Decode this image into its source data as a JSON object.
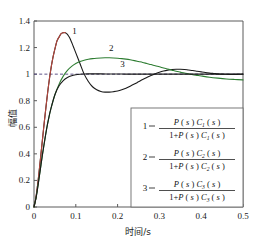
{
  "chart_data": {
    "type": "line",
    "title": "",
    "xlabel": "时间/s",
    "ylabel": "幅值",
    "xlim": [
      0,
      0.5
    ],
    "ylim": [
      0,
      1.4
    ],
    "xticks": [
      "0",
      "0.1",
      "0.2",
      "0.3",
      "0.4",
      "0.5"
    ],
    "xtick_values": [
      0,
      0.1,
      0.2,
      0.3,
      0.4,
      0.5
    ],
    "yticks": [
      "0",
      "0.2",
      "0.4",
      "0.6",
      "0.8",
      "1",
      "1.2",
      "1.4"
    ],
    "ytick_values": [
      0,
      0.2,
      0.4,
      0.6,
      0.8,
      1.0,
      1.2,
      1.4
    ],
    "grid": false,
    "legend_position": "lower-right",
    "reference_line": {
      "name": "unit-step-reference",
      "y": 1.0,
      "style": "dashed",
      "color": "#4b3f7a"
    },
    "series": [
      {
        "name": "curve-1",
        "label": "1",
        "color": "#1a1a1a",
        "label_x": 0.097,
        "label_y": 1.3,
        "x": [
          0,
          0.004,
          0.008,
          0.012,
          0.016,
          0.02,
          0.025,
          0.03,
          0.035,
          0.04,
          0.045,
          0.05,
          0.055,
          0.06,
          0.065,
          0.07,
          0.075,
          0.08,
          0.085,
          0.09,
          0.095,
          0.1,
          0.11,
          0.12,
          0.13,
          0.14,
          0.15,
          0.16,
          0.17,
          0.18,
          0.19,
          0.2,
          0.21,
          0.22,
          0.23,
          0.24,
          0.25,
          0.26,
          0.27,
          0.28,
          0.29,
          0.3,
          0.31,
          0.32,
          0.33,
          0.34,
          0.35,
          0.36,
          0.37,
          0.38,
          0.39,
          0.4,
          0.41,
          0.42,
          0.43,
          0.44,
          0.45,
          0.46,
          0.47,
          0.48,
          0.49,
          0.5
        ],
        "y": [
          0,
          0.06,
          0.15,
          0.26,
          0.38,
          0.5,
          0.65,
          0.79,
          0.92,
          1.03,
          1.12,
          1.19,
          1.25,
          1.28,
          1.305,
          1.312,
          1.312,
          1.3,
          1.275,
          1.24,
          1.2,
          1.16,
          1.08,
          1.0,
          0.945,
          0.905,
          0.882,
          0.87,
          0.865,
          0.865,
          0.868,
          0.873,
          0.882,
          0.894,
          0.909,
          0.925,
          0.942,
          0.959,
          0.975,
          0.99,
          1.003,
          1.014,
          1.023,
          1.03,
          1.035,
          1.037,
          1.037,
          1.035,
          1.031,
          1.027,
          1.022,
          1.017,
          1.012,
          1.008,
          1.005,
          1.002,
          1.0,
          0.999,
          0.998,
          0.998,
          0.999,
          1.0
        ]
      },
      {
        "name": "curve-1-red-segment",
        "label": "",
        "color": "#b5463c",
        "x": [
          0,
          0.004,
          0.008,
          0.012,
          0.016,
          0.02,
          0.025,
          0.03,
          0.035,
          0.04,
          0.045,
          0.05,
          0.055,
          0.06,
          0.065,
          0.07,
          0.075
        ],
        "y": [
          0,
          0.06,
          0.15,
          0.26,
          0.38,
          0.5,
          0.65,
          0.79,
          0.92,
          1.03,
          1.12,
          1.19,
          1.25,
          1.28,
          1.305,
          1.312,
          1.312
        ]
      },
      {
        "name": "curve-2",
        "label": "2",
        "color": "#2e7d32",
        "label_x": 0.185,
        "label_y": 1.175,
        "x": [
          0,
          0.005,
          0.01,
          0.015,
          0.02,
          0.025,
          0.03,
          0.035,
          0.04,
          0.05,
          0.06,
          0.07,
          0.08,
          0.09,
          0.1,
          0.11,
          0.12,
          0.13,
          0.14,
          0.15,
          0.16,
          0.17,
          0.18,
          0.19,
          0.2,
          0.21,
          0.22,
          0.23,
          0.24,
          0.25,
          0.26,
          0.27,
          0.28,
          0.29,
          0.3,
          0.31,
          0.32,
          0.33,
          0.34,
          0.35,
          0.36,
          0.37,
          0.38,
          0.39,
          0.4,
          0.42,
          0.44,
          0.46,
          0.48,
          0.5
        ],
        "y": [
          0,
          0.07,
          0.17,
          0.28,
          0.39,
          0.49,
          0.585,
          0.665,
          0.735,
          0.845,
          0.925,
          0.985,
          1.028,
          1.058,
          1.08,
          1.095,
          1.105,
          1.112,
          1.117,
          1.12,
          1.122,
          1.123,
          1.123,
          1.122,
          1.12,
          1.117,
          1.113,
          1.108,
          1.102,
          1.095,
          1.088,
          1.08,
          1.072,
          1.063,
          1.055,
          1.046,
          1.038,
          1.03,
          1.022,
          1.015,
          1.008,
          1.002,
          0.996,
          0.991,
          0.986,
          0.977,
          0.97,
          0.964,
          0.96,
          0.957
        ]
      },
      {
        "name": "curve-3",
        "label": "3",
        "color": "#1a1a1a",
        "label_x": 0.212,
        "label_y": 1.052,
        "x": [
          0,
          0.005,
          0.01,
          0.015,
          0.02,
          0.025,
          0.03,
          0.035,
          0.04,
          0.05,
          0.06,
          0.07,
          0.08,
          0.09,
          0.1,
          0.11,
          0.12,
          0.13,
          0.14,
          0.15,
          0.16,
          0.18,
          0.2,
          0.22,
          0.25,
          0.3,
          0.35,
          0.4,
          0.45,
          0.5
        ],
        "y": [
          0,
          0.07,
          0.17,
          0.28,
          0.39,
          0.49,
          0.585,
          0.665,
          0.735,
          0.845,
          0.912,
          0.952,
          0.975,
          0.988,
          0.995,
          0.999,
          1.001,
          1.002,
          1.002,
          1.002,
          1.002,
          1.001,
          1.001,
          1.0,
          1.0,
          1.0,
          1.0,
          1.0,
          1.0,
          1.0
        ]
      }
    ],
    "legend_entries": [
      {
        "name": "legend-entry-1",
        "index": "1",
        "numerator": "P ( s ) C₁ ( s )",
        "denominator": "1+P ( s ) C₁ ( s )",
        "num_parts": {
          "p": "P",
          "lp": "( ",
          "s1": "s",
          "rp": " ) ",
          "c": "C",
          "sub": "1",
          "lp2": "( ",
          "s2": "s",
          "rp2": " )"
        },
        "den_prefix": "1+"
      },
      {
        "name": "legend-entry-2",
        "index": "2",
        "numerator": "P ( s ) C₂ ( s )",
        "denominator": "1+P ( s ) C₂ ( s )",
        "num_parts": {
          "p": "P",
          "lp": "( ",
          "s1": "s",
          "rp": " ) ",
          "c": "C",
          "sub": "2",
          "lp2": "( ",
          "s2": "s",
          "rp2": " )"
        },
        "den_prefix": "1+"
      },
      {
        "name": "legend-entry-3",
        "index": "3",
        "numerator": "P ( s ) C₃ ( s )",
        "denominator": "1+P ( s ) C₃ ( s )",
        "num_parts": {
          "p": "P",
          "lp": "( ",
          "s1": "s",
          "rp": " ) ",
          "c": "C",
          "sub": "3",
          "lp2": "( ",
          "s2": "s",
          "rp2": " )"
        },
        "den_prefix": "1+"
      }
    ]
  }
}
